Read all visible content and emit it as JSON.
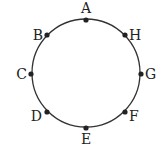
{
  "diagram": {
    "type": "circle-with-points",
    "circle": {
      "cx": 86,
      "cy": 73,
      "r": 54,
      "stroke": "#333333"
    },
    "points": [
      {
        "label": "A",
        "x": 86,
        "y": 20,
        "lx": 86,
        "ly": 13,
        "anchor": "middle"
      },
      {
        "label": "H",
        "x": 125,
        "y": 35,
        "lx": 129,
        "ly": 40,
        "anchor": "start"
      },
      {
        "label": "G",
        "x": 141,
        "y": 74,
        "lx": 145,
        "ly": 79,
        "anchor": "start"
      },
      {
        "label": "F",
        "x": 125,
        "y": 112,
        "lx": 129,
        "ly": 121,
        "anchor": "start"
      },
      {
        "label": "E",
        "x": 86,
        "y": 128,
        "lx": 86,
        "ly": 144,
        "anchor": "middle"
      },
      {
        "label": "D",
        "x": 47,
        "y": 112,
        "lx": 42,
        "ly": 121,
        "anchor": "end"
      },
      {
        "label": "C",
        "x": 31,
        "y": 74,
        "lx": 27,
        "ly": 79,
        "anchor": "end"
      },
      {
        "label": "B",
        "x": 47,
        "y": 35,
        "lx": 43,
        "ly": 40,
        "anchor": "end"
      }
    ]
  }
}
